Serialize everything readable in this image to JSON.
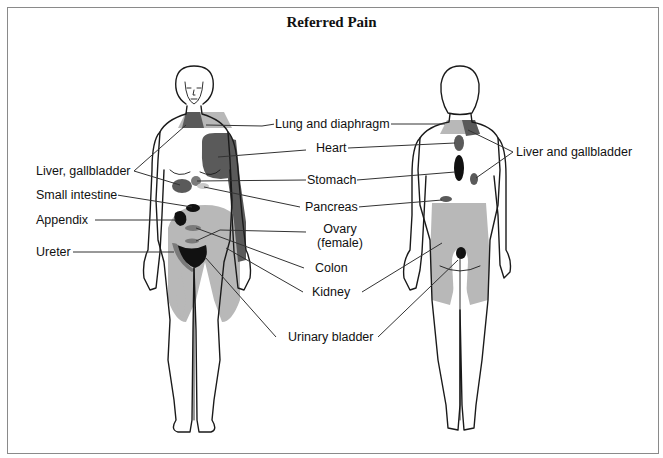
{
  "title": "Referred Pain",
  "colors": {
    "outline": "#1a1a1a",
    "light_shade": "#b8b8b8",
    "mid_shade": "#7a7a7a",
    "dark_shade": "#5a5a5a",
    "black_shade": "#111111",
    "leader_line": "#333333",
    "frame": "#8a8a8a"
  },
  "figures": {
    "front": {
      "label": "front-view-female-figure"
    },
    "back": {
      "label": "back-view-figure"
    }
  },
  "labels": {
    "lung_and_diaphragm": "Lung and diaphragm",
    "heart": "Heart",
    "stomach": "Stomach",
    "pancreas": "Pancreas",
    "ovary_line1": "Ovary",
    "ovary_line2": "(female)",
    "colon": "Colon",
    "kidney": "Kidney",
    "urinary_bladder": "Urinary bladder",
    "liver_gallbladder_front": "Liver, gallbladder",
    "small_intestine": "Small intestine",
    "appendix": "Appendix",
    "ureter": "Ureter",
    "liver_and_gallbladder_back": "Liver and gallbladder"
  }
}
